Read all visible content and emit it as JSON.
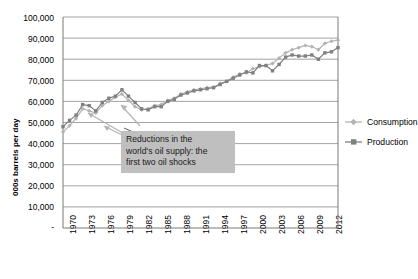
{
  "chart_data": {
    "type": "line",
    "title": "",
    "xlabel": "",
    "ylabel": "000s barrels per day",
    "ylim": [
      0,
      100000
    ],
    "xlim": [
      1970,
      2012
    ],
    "grid": true,
    "legend_position": "right",
    "y_ticks": [
      "-",
      "10,000",
      "20,000",
      "30,000",
      "40,000",
      "50,000",
      "60,000",
      "70,000",
      "80,000",
      "90,000",
      "100,000"
    ],
    "y_tick_values": [
      0,
      10000,
      20000,
      30000,
      40000,
      50000,
      60000,
      70000,
      80000,
      90000,
      100000
    ],
    "x_ticks": [
      "1970",
      "1973",
      "1976",
      "1979",
      "1982",
      "1985",
      "1988",
      "1991",
      "1994",
      "1997",
      "2000",
      "2003",
      "2006",
      "2009",
      "2012"
    ],
    "x": [
      1970,
      1971,
      1972,
      1973,
      1974,
      1975,
      1976,
      1977,
      1978,
      1979,
      1980,
      1981,
      1982,
      1983,
      1984,
      1985,
      1986,
      1987,
      1988,
      1989,
      1990,
      1991,
      1992,
      1993,
      1994,
      1995,
      1996,
      1997,
      1998,
      1999,
      2000,
      2001,
      2002,
      2003,
      2004,
      2005,
      2006,
      2007,
      2008,
      2009,
      2010,
      2011,
      2012
    ],
    "series": [
      {
        "name": "Consumption",
        "color": "#b3b3b3",
        "marker": "diamond",
        "values": [
          45500,
          48500,
          52000,
          56500,
          55500,
          54500,
          58000,
          60000,
          62000,
          63500,
          60500,
          57500,
          56000,
          56500,
          58000,
          58500,
          60500,
          61500,
          63500,
          64500,
          65500,
          66000,
          66500,
          66800,
          68500,
          69500,
          71500,
          73000,
          73500,
          75500,
          76500,
          77000,
          78000,
          80500,
          83000,
          84500,
          85500,
          86500,
          86000,
          84500,
          87500,
          88500,
          89000
        ]
      },
      {
        "name": "Production",
        "color": "#808080",
        "marker": "square",
        "values": [
          48000,
          51000,
          53500,
          58500,
          58000,
          55500,
          59500,
          61500,
          62500,
          65500,
          62500,
          59500,
          56500,
          56000,
          57500,
          57500,
          60000,
          61000,
          63000,
          64000,
          65000,
          65500,
          66000,
          66500,
          68000,
          69500,
          71000,
          72500,
          74000,
          73500,
          77000,
          77000,
          74500,
          77500,
          81000,
          82000,
          81500,
          81500,
          82000,
          80000,
          83000,
          83500,
          85500
        ]
      }
    ],
    "annotations": [
      {
        "text_lines": [
          "Reductions in the",
          "world's oil supply: the",
          "first two oil shocks"
        ],
        "background": "#bfbfbf"
      }
    ]
  },
  "legend": {
    "items": [
      {
        "label": "Consumption",
        "color": "#b3b3b3"
      },
      {
        "label": "Production",
        "color": "#808080"
      }
    ]
  }
}
